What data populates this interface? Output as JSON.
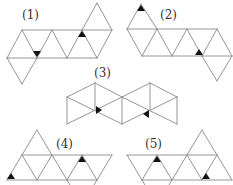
{
  "figure": {
    "colors": {
      "edge": "#8a8a8a",
      "mark": "#111111",
      "background": "#ffffff"
    },
    "nets": [
      {
        "id": 1,
        "label": "(1)",
        "marks": 2
      },
      {
        "id": 2,
        "label": "(2)",
        "marks": 2
      },
      {
        "id": 3,
        "label": "(3)",
        "marks": 2
      },
      {
        "id": 4,
        "label": "(4)",
        "marks": 2
      },
      {
        "id": 5,
        "label": "(5)",
        "marks": 2
      }
    ]
  }
}
